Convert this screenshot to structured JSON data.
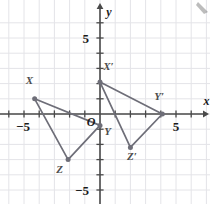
{
  "figure": {
    "background_color": "#ffffff",
    "grid_color": "#e4e4e8",
    "axis_color": "#4a4a4a",
    "shape_color": "#6e6e78",
    "label_color": "#1a1a1a"
  },
  "axes": {
    "x_axis_label": "x",
    "y_axis_label": "y",
    "origin_label": "O",
    "x_ticks": [
      {
        "value": -5,
        "label": "−5"
      },
      {
        "value": 5,
        "label": "5"
      }
    ],
    "y_ticks": [
      {
        "value": 5,
        "label": "5"
      },
      {
        "value": -5,
        "label": "−5"
      }
    ],
    "xlim": [
      -6.6,
      7.2
    ],
    "ylim": [
      -5.9,
      6.2
    ],
    "grid": true,
    "grid_step": 1
  },
  "chart_data": {
    "type": "scatter",
    "xlabel": "x",
    "ylabel": "y",
    "xlim": [
      -6.6,
      7.2
    ],
    "ylim": [
      -5.9,
      6.2
    ],
    "grid": true,
    "legend": "none",
    "series": [
      {
        "name": "Triangle XYZ",
        "closed": true,
        "points": [
          {
            "label": "X",
            "x": -4.3,
            "y": 1.0,
            "label_dx": -0.35,
            "label_dy": 0.95
          },
          {
            "label": "Y",
            "x": 0.0,
            "y": -0.75,
            "label_dx": 0.5,
            "label_dy": -0.65
          },
          {
            "label": "Z",
            "x": -2.1,
            "y": -3.0,
            "label_dx": -0.55,
            "label_dy": -0.85
          }
        ]
      },
      {
        "name": "Triangle X'Y'Z'",
        "closed": true,
        "points": [
          {
            "label": "X′",
            "x": 0.0,
            "y": 2.1,
            "label_dx": 0.55,
            "label_dy": 0.8
          },
          {
            "label": "Y′",
            "x": 4.1,
            "y": 0.0,
            "label_dx": -0.2,
            "label_dy": 0.95
          },
          {
            "label": "Z′",
            "x": 2.0,
            "y": -2.2,
            "label_dx": 0.1,
            "label_dy": -0.85
          }
        ]
      }
    ]
  }
}
